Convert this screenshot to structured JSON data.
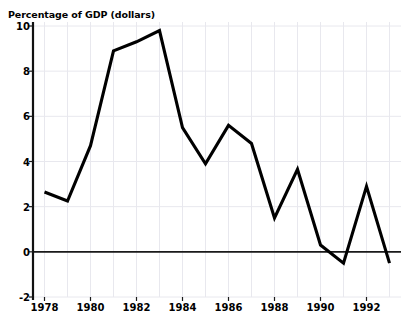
{
  "header": {
    "cropped_top_text": "",
    "axis_title": "Percentage of GDP (dollars)"
  },
  "colors": {
    "line": "#000000",
    "axis": "#1a1a1a",
    "grid": "#e8e8ee",
    "background": "#ffffff",
    "tick_text": "#000000"
  },
  "chart_data": {
    "type": "line",
    "title": "Percentage of GDP (dollars)",
    "xlabel": "",
    "ylabel": "Percentage of GDP (dollars)",
    "xlim": [
      1977.5,
      1993.5
    ],
    "ylim": [
      -2,
      10
    ],
    "ytick_values": [
      10,
      8,
      6,
      4,
      2,
      0,
      -2
    ],
    "ytick_labels": [
      "10",
      "8",
      "6",
      "4",
      "2",
      "0",
      "-2"
    ],
    "xtick_values": [
      1978,
      1980,
      1982,
      1984,
      1986,
      1988,
      1990,
      1992
    ],
    "xtick_labels": [
      "1978",
      "1980",
      "1982",
      "1984",
      "1986",
      "1988",
      "1990",
      "1992"
    ],
    "grid": true,
    "grid_vertical_every": 1,
    "legend": "none",
    "zero_line": 0,
    "x": [
      1978,
      1979,
      1980,
      1981,
      1982,
      1983,
      1984,
      1985,
      1986,
      1987,
      1988,
      1989,
      1990,
      1991,
      1992,
      1993
    ],
    "values": [
      2.65,
      2.25,
      4.7,
      8.9,
      9.3,
      9.8,
      5.5,
      3.9,
      5.6,
      4.8,
      1.5,
      3.65,
      0.3,
      -0.5,
      2.9,
      -0.5
    ],
    "series": [
      {
        "name": "Percentage of GDP",
        "values": [
          2.65,
          2.25,
          4.7,
          8.9,
          9.3,
          9.8,
          5.5,
          3.9,
          5.6,
          4.8,
          1.5,
          3.65,
          0.3,
          -0.5,
          2.9,
          -0.5
        ]
      }
    ]
  }
}
